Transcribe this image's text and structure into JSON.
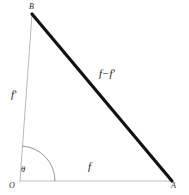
{
  "figure": {
    "background_color": "#ffffff",
    "width": 189,
    "height": 195,
    "vertices": {
      "B": {
        "label": "B",
        "x": 32,
        "y": 14
      },
      "O": {
        "label": "O",
        "x": 20,
        "y": 181
      },
      "A": {
        "label": "A",
        "x": 172,
        "y": 181
      }
    },
    "sides": {
      "vertical": {
        "label": "f'",
        "from": "O",
        "to": "B",
        "color": "#b0b0b0",
        "stroke_width": 0.9
      },
      "hypotenuse": {
        "label": "f−f'",
        "from": "B",
        "to": "A",
        "color": "#111111",
        "stroke_width": 3.2
      },
      "base": {
        "label": "f",
        "from": "O",
        "to": "A",
        "color": "#b8b8b8",
        "stroke_width": 0.9
      }
    },
    "angle": {
      "label": "θ",
      "at_vertex": "O",
      "arc_radius": 35,
      "arc_color": "#8a8a8a",
      "arc_stroke_width": 0.9
    }
  }
}
